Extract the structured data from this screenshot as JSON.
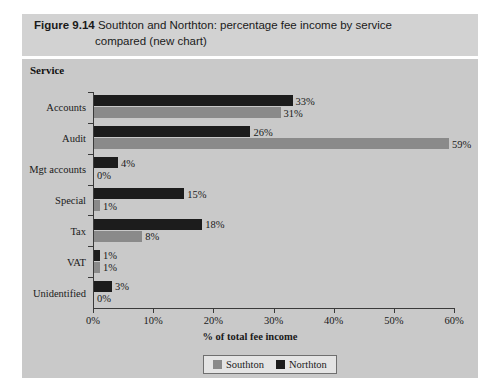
{
  "figure": {
    "label": "Figure 9.14",
    "title_line1": "Southton and Northton: percentage fee income by service",
    "title_line2": "compared (new chart)",
    "category_axis_title": "Service"
  },
  "legend": {
    "position": "bottom",
    "items": [
      {
        "name": "Southton",
        "color": "#8a8a8a"
      },
      {
        "name": "Northton",
        "color": "#1c1c1c"
      }
    ]
  },
  "chart_data": {
    "type": "bar",
    "orientation": "horizontal",
    "title": "Southton and Northton: percentage fee income by service compared (new chart)",
    "xlabel": "% of total fee income",
    "ylabel": "Service",
    "xlim": [
      0,
      60
    ],
    "xticks": [
      "0%",
      "10%",
      "20%",
      "30%",
      "40%",
      "50%",
      "60%"
    ],
    "xtick_values": [
      0,
      10,
      20,
      30,
      40,
      50,
      60
    ],
    "grid": false,
    "categories": [
      "Accounts",
      "Audit",
      "Mgt accounts",
      "Special",
      "Tax",
      "VAT",
      "Unidentified"
    ],
    "series": [
      {
        "name": "Southton",
        "color": "#8a8a8a",
        "values": [
          31,
          59,
          0,
          1,
          8,
          1,
          0
        ],
        "labels": [
          "31%",
          "59%",
          "0%",
          "1%",
          "8%",
          "1%",
          "0%"
        ]
      },
      {
        "name": "Northton",
        "color": "#1c1c1c",
        "values": [
          33,
          26,
          4,
          15,
          18,
          1,
          3
        ],
        "labels": [
          "33%",
          "26%",
          "4%",
          "15%",
          "18%",
          "1%",
          "3%"
        ]
      }
    ]
  }
}
